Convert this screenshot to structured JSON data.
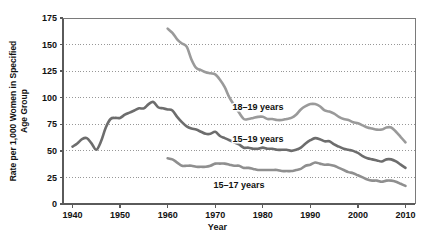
{
  "figure": {
    "top_cut_text": "",
    "background": "#ffffff"
  },
  "axis": {
    "xlabel": "Year",
    "ylabel_line1": "Rate per 1,000 Women in Specified",
    "ylabel_line2": "Age Group",
    "ylabel": "Rate per 1,000 Women in Specified Age Group",
    "yticks": [
      "0",
      "25",
      "50",
      "75",
      "100",
      "125",
      "150",
      "175"
    ],
    "xticks": [
      "1940",
      "1950",
      "1960",
      "1970",
      "1980",
      "1990",
      "2000",
      "2010"
    ]
  },
  "colors": {
    "series_18_19": "#9a9a9a",
    "series_15_19": "#6d6d6d",
    "series_15_17": "#8f8f8f",
    "axis": "#5a5a5a",
    "grid": "#8c8c8c",
    "text": "#111111"
  },
  "chart_data": {
    "type": "line",
    "title": "",
    "xlabel": "Year",
    "ylabel": "Rate per 1,000 Women in Specified Age Group",
    "xlim": [
      1938,
      2012
    ],
    "ylim": [
      0,
      175
    ],
    "yticks": [
      0,
      25,
      50,
      75,
      100,
      125,
      150,
      175
    ],
    "xticks": [
      1940,
      1950,
      1960,
      1970,
      1980,
      1990,
      2000,
      2010
    ],
    "grid": "horizontal-dotted",
    "legend": "inline-labels",
    "series": [
      {
        "name": "18–19 years",
        "color": "#9a9a9a",
        "label_x": 1979,
        "label_y": 88,
        "x": [
          1960,
          1961,
          1962,
          1963,
          1964,
          1965,
          1966,
          1967,
          1968,
          1969,
          1970,
          1971,
          1972,
          1973,
          1974,
          1975,
          1976,
          1977,
          1978,
          1979,
          1980,
          1981,
          1982,
          1983,
          1984,
          1985,
          1986,
          1987,
          1988,
          1989,
          1990,
          1991,
          1992,
          1993,
          1994,
          1995,
          1996,
          1997,
          1998,
          1999,
          2000,
          2001,
          2002,
          2003,
          2004,
          2005,
          2006,
          2007,
          2008,
          2009,
          2010
        ],
        "y": [
          165,
          161,
          155,
          151,
          148,
          136,
          128,
          126,
          124,
          123,
          122,
          117,
          110,
          100,
          93,
          86,
          80,
          80,
          81,
          82,
          82,
          80,
          80,
          79,
          79,
          80,
          81,
          84,
          89,
          92,
          94,
          94,
          92,
          88,
          87,
          85,
          82,
          80,
          79,
          77,
          76,
          74,
          72,
          71,
          70,
          70,
          72,
          72,
          68,
          63,
          58
        ]
      },
      {
        "name": "15–19 years",
        "color": "#6d6d6d",
        "label_x": 1979,
        "label_y": 58,
        "x": [
          1940,
          1941,
          1942,
          1943,
          1944,
          1945,
          1946,
          1947,
          1948,
          1949,
          1950,
          1951,
          1952,
          1953,
          1954,
          1955,
          1956,
          1957,
          1958,
          1959,
          1960,
          1961,
          1962,
          1963,
          1964,
          1965,
          1966,
          1967,
          1968,
          1969,
          1970,
          1971,
          1972,
          1973,
          1974,
          1975,
          1976,
          1977,
          1978,
          1979,
          1980,
          1981,
          1982,
          1983,
          1984,
          1985,
          1986,
          1987,
          1988,
          1989,
          1990,
          1991,
          1992,
          1993,
          1994,
          1995,
          1996,
          1997,
          1998,
          1999,
          2000,
          2001,
          2002,
          2003,
          2004,
          2005,
          2006,
          2007,
          2008,
          2009,
          2010
        ],
        "y": [
          54,
          57,
          61,
          62,
          57,
          51,
          59,
          72,
          80,
          81,
          81,
          84,
          86,
          88,
          90,
          90,
          94,
          96,
          91,
          90,
          89,
          88,
          82,
          77,
          73,
          71,
          70,
          68,
          66,
          66,
          68,
          64,
          62,
          60,
          58,
          56,
          53,
          53,
          52,
          52,
          53,
          52,
          52,
          51,
          51,
          51,
          50,
          51,
          53,
          57,
          60,
          62,
          61,
          59,
          59,
          56,
          54,
          52,
          51,
          50,
          48,
          45,
          43,
          42,
          41,
          40,
          42,
          42,
          40,
          37,
          34
        ]
      },
      {
        "name": "15–17 years",
        "color": "#8f8f8f",
        "label_x": 1975,
        "label_y": 15,
        "x": [
          1960,
          1961,
          1962,
          1963,
          1964,
          1965,
          1966,
          1967,
          1968,
          1969,
          1970,
          1971,
          1972,
          1973,
          1974,
          1975,
          1976,
          1977,
          1978,
          1979,
          1980,
          1981,
          1982,
          1983,
          1984,
          1985,
          1986,
          1987,
          1988,
          1989,
          1990,
          1991,
          1992,
          1993,
          1994,
          1995,
          1996,
          1997,
          1998,
          1999,
          2000,
          2001,
          2002,
          2003,
          2004,
          2005,
          2006,
          2007,
          2008,
          2009,
          2010
        ],
        "y": [
          43,
          42,
          39,
          36,
          36,
          36,
          35,
          35,
          35,
          36,
          38,
          38,
          38,
          37,
          36,
          36,
          34,
          34,
          33,
          32,
          32,
          32,
          32,
          32,
          31,
          31,
          31,
          32,
          33,
          36,
          37,
          39,
          38,
          37,
          37,
          36,
          34,
          32,
          30,
          29,
          27,
          25,
          23,
          22,
          22,
          21,
          22,
          22,
          21,
          19,
          17
        ]
      }
    ]
  }
}
